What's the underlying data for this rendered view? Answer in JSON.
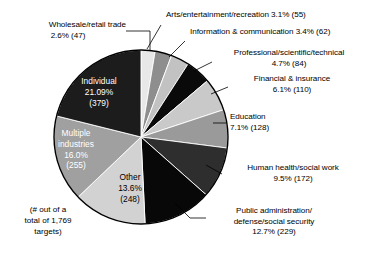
{
  "chart_data": {
    "type": "pie",
    "title": "",
    "subtitle": "",
    "xlabel": "",
    "ylabel": "",
    "legend_position": "none",
    "grid": false,
    "total": 1769,
    "units": "targets",
    "footnote": [
      "(# out of a",
      "total of 1,769",
      "targets)"
    ],
    "categories": [
      "Wholesale/retail trade",
      "Arts/entertainment/recreation",
      "Information & communication",
      "Professional/scientific/technical",
      "Financial & insurance",
      "Education",
      "Human health/social work",
      "Public administration/defense/social security",
      "Other",
      "Multiple industries",
      "Individual"
    ],
    "values": [
      2.6,
      3.1,
      3.4,
      4.7,
      6.1,
      7.1,
      9.5,
      12.7,
      13.6,
      16.0,
      21.09
    ],
    "counts": [
      47,
      55,
      62,
      84,
      110,
      128,
      172,
      229,
      248,
      255,
      379
    ],
    "colors": [
      "#e8e8e8",
      "#8e8e8e",
      "#c2c2c2",
      "#0a0a0a",
      "#c9c9c9",
      "#9a9a9a",
      "#2e2e2e",
      "#080808",
      "#d2d2d2",
      "#a0a0a0",
      "#1c1c1c"
    ]
  },
  "slices": {
    "wholesale": {
      "name": "Wholesale/retail trade",
      "line1": "Wholesale/retail trade",
      "line2": "2.6% (47)",
      "percent": "2.6%",
      "count": "(47)"
    },
    "arts": {
      "name": "Arts/entertainment/recreation",
      "line1": "Arts/entertainment/recreation  3.1% (55)",
      "percent": "3.1%",
      "count": "(55)"
    },
    "information": {
      "name": "Information & communication",
      "line1": "Information & communication  3.4% (62)",
      "percent": "3.4%",
      "count": "(62)"
    },
    "professional": {
      "name": "Professional/scientific/technical",
      "line1": "Professional/scientific/technical",
      "line2": "4.7% (84)",
      "percent": "4.7%",
      "count": "(84)"
    },
    "financial": {
      "name": "Financial & insurance",
      "line1": "Financial & insurance",
      "line2": "6.1% (110)",
      "percent": "6.1%",
      "count": "(110)"
    },
    "education": {
      "name": "Education",
      "line1": "Education",
      "line2": "7.1% (128)",
      "percent": "7.1%",
      "count": "(128)"
    },
    "health": {
      "name": "Human health/social work",
      "line1": "Human health/social work",
      "line2": "9.5% (172)",
      "percent": "9.5%",
      "count": "(172)"
    },
    "public": {
      "name": "Public administration/defense/social security",
      "line1": "Public administration/",
      "line2": "defense/social security",
      "line3": "12.7% (229)",
      "percent": "12.7%",
      "count": "(229)"
    },
    "other": {
      "name": "Other",
      "line1": "Other",
      "line2": "13.6%",
      "line3": "(248)"
    },
    "multiple": {
      "name": "Multiple industries",
      "line1": "Multiple",
      "line2": "industries",
      "line3": "16.0%",
      "line4": "(255)"
    },
    "individual": {
      "name": "Individual",
      "line1": "Individual",
      "line2": "21.09%",
      "line3": "(379)"
    }
  },
  "footnote": {
    "line1": "(# out of a",
    "line2": "total of 1,769",
    "line3": "targets)"
  }
}
